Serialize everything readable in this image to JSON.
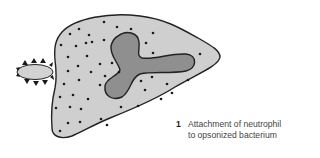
{
  "figure": {
    "step_number": "1",
    "caption_line1": "Attachment of neutrophil",
    "caption_line2": "to opsonized bacterium"
  },
  "colors": {
    "cytoplasm_fill": "#cfcfcf",
    "nucleus_fill": "#8f8f8f",
    "outline": "#222222",
    "granule": "#1a1a1a",
    "bacterium_fill": "#d2d2d2",
    "opsonin_triangle": "#1a1a1a"
  },
  "elements": {
    "cell": "neutrophil",
    "nucleus": "multilobed nucleus",
    "bacterium": "opsonized bacterium",
    "opsonins": "antibody/complement triangles"
  }
}
